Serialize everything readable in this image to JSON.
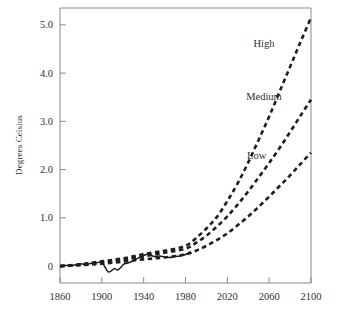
{
  "chart_data": {
    "type": "line",
    "title": "",
    "subtitle": "",
    "xlabel": "",
    "ylabel": "Degrees Celsius",
    "xlim": [
      1860,
      2100
    ],
    "ylim": [
      -0.35,
      5.35
    ],
    "grid": false,
    "legend_position": "inline-right",
    "x_ticks": [
      "1860",
      "1900",
      "1940",
      "1980",
      "2020",
      "2060",
      "2100"
    ],
    "x_tick_values": [
      1860,
      1900,
      1940,
      1980,
      2020,
      2060,
      2100
    ],
    "y_ticks": [
      "0",
      "1.0",
      "2.0",
      "3.0",
      "4.0",
      "5.0"
    ],
    "y_tick_values": [
      0,
      1.0,
      2.0,
      3.0,
      4.0,
      5.0
    ],
    "annotations": [
      {
        "text": "High",
        "x": 2055,
        "y": 4.55
      },
      {
        "text": "Medium",
        "x": 2055,
        "y": 3.45
      },
      {
        "text": "Low",
        "x": 2048,
        "y": 2.22
      }
    ],
    "series": [
      {
        "name": "Observed",
        "style": "solid",
        "color": "#1e1e1e",
        "x": [
          1860,
          1865,
          1870,
          1875,
          1880,
          1885,
          1890,
          1895,
          1900,
          1903,
          1906,
          1909,
          1912,
          1915,
          1918,
          1921,
          1924,
          1927,
          1930,
          1935,
          1940,
          1945,
          1950,
          1955,
          1960,
          1965,
          1970,
          1975,
          1980,
          1985
        ],
        "values": [
          0.0,
          0.02,
          0.0,
          0.03,
          0.05,
          0.03,
          0.06,
          0.07,
          0.08,
          -0.02,
          -0.12,
          -0.1,
          -0.05,
          -0.08,
          -0.03,
          0.04,
          0.06,
          0.08,
          0.11,
          0.17,
          0.22,
          0.25,
          0.2,
          0.21,
          0.19,
          0.18,
          0.2,
          0.21,
          0.24,
          0.3
        ]
      },
      {
        "name": "High",
        "style": "dashed",
        "color": "#1e1e1e",
        "x": [
          1860,
          1880,
          1900,
          1920,
          1940,
          1960,
          1980,
          1990,
          2000,
          2010,
          2020,
          2030,
          2040,
          2050,
          2060,
          2070,
          2080,
          2090,
          2100
        ],
        "values": [
          0.0,
          0.04,
          0.1,
          0.16,
          0.25,
          0.32,
          0.42,
          0.58,
          0.78,
          1.02,
          1.35,
          1.72,
          2.15,
          2.62,
          3.1,
          3.62,
          4.13,
          4.65,
          5.15
        ]
      },
      {
        "name": "Medium",
        "style": "dashed",
        "color": "#1e1e1e",
        "x": [
          1860,
          1880,
          1900,
          1920,
          1940,
          1960,
          1980,
          1990,
          2000,
          2010,
          2020,
          2030,
          2040,
          2050,
          2060,
          2070,
          2080,
          2090,
          2100
        ],
        "values": [
          0.0,
          0.03,
          0.08,
          0.13,
          0.2,
          0.28,
          0.36,
          0.48,
          0.63,
          0.82,
          1.03,
          1.28,
          1.55,
          1.84,
          2.14,
          2.45,
          2.78,
          3.12,
          3.45
        ]
      },
      {
        "name": "Low",
        "style": "dashed",
        "color": "#1e1e1e",
        "x": [
          1860,
          1880,
          1900,
          1920,
          1940,
          1960,
          1980,
          1990,
          2000,
          2010,
          2020,
          2030,
          2040,
          2050,
          2060,
          2070,
          2080,
          2090,
          2100
        ],
        "values": [
          0.0,
          0.02,
          0.05,
          0.09,
          0.14,
          0.18,
          0.24,
          0.32,
          0.42,
          0.54,
          0.68,
          0.85,
          1.03,
          1.23,
          1.44,
          1.66,
          1.88,
          2.12,
          2.35
        ]
      }
    ]
  },
  "style": {
    "axis_color": "#8a8a8a",
    "line_color": "#1e1e1e",
    "text_color": "#2f2f2f",
    "background": "#ffffff"
  }
}
